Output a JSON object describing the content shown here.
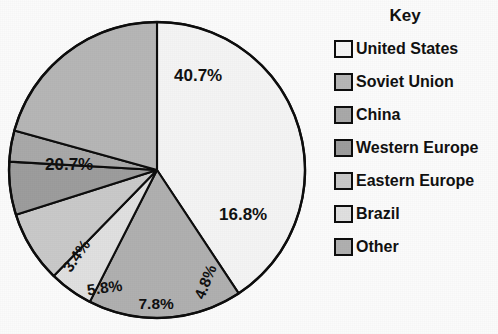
{
  "title": "Share of World Total",
  "legend": {
    "heading": "Key"
  },
  "chart_data": {
    "type": "pie",
    "title": "Share of World Total",
    "value_suffix": "%",
    "legend_position": "right",
    "legend_title": "Key",
    "start_angle_deg": 0,
    "direction": "clockwise",
    "center": {
      "x": 157,
      "y": 170
    },
    "radius": 148,
    "categories": [
      "United States",
      "Soviet Union",
      "China",
      "Western Europe",
      "Eastern Europe",
      "Brazil",
      "Other"
    ],
    "values": [
      40.7,
      20.7,
      3.4,
      5.8,
      7.8,
      4.8,
      16.8
    ],
    "labels": [
      "40.7%",
      "20.7%",
      "3.4%",
      "5.8%",
      "7.8%",
      "4.8%",
      "16.8%"
    ],
    "colors": [
      "#f4f4f4",
      "#b6b6b6",
      "#a9a9a9",
      "#9d9d9d",
      "#c9c9c9",
      "#e0e0e0",
      "#b0b0b0"
    ],
    "slices": [
      {
        "name": "United States",
        "value": 40.7,
        "label": "40.7%",
        "color": "#f4f4f4",
        "label_pos": {
          "x": 198,
          "y": 76
        },
        "label_rotation": 0
      },
      {
        "name": "Other",
        "value": 16.8,
        "label": "16.8%",
        "color": "#b0b0b0",
        "label_pos": {
          "x": 243,
          "y": 215
        },
        "label_rotation": 0
      },
      {
        "name": "Brazil",
        "value": 4.8,
        "label": "4.8%",
        "color": "#e0e0e0",
        "label_pos": {
          "x": 205,
          "y": 282
        },
        "label_rotation": -68
      },
      {
        "name": "Eastern Europe",
        "value": 7.8,
        "label": "7.8%",
        "color": "#c9c9c9",
        "label_pos": {
          "x": 156,
          "y": 304
        },
        "label_rotation": 0
      },
      {
        "name": "Western Europe",
        "value": 5.8,
        "label": "5.8%",
        "color": "#9d9d9d",
        "label_pos": {
          "x": 104,
          "y": 288
        },
        "label_rotation": -8
      },
      {
        "name": "China",
        "value": 3.4,
        "label": "3.4%",
        "color": "#a9a9a9",
        "label_pos": {
          "x": 76,
          "y": 256
        },
        "label_rotation": -55
      },
      {
        "name": "Soviet Union",
        "value": 20.7,
        "label": "20.7%",
        "color": "#b6b6b6",
        "label_pos": {
          "x": 69,
          "y": 165
        },
        "label_rotation": 0
      }
    ],
    "legend_entries": [
      {
        "label": "United States",
        "color": "#f4f4f4"
      },
      {
        "label": "Soviet Union",
        "color": "#b6b6b6"
      },
      {
        "label": "China",
        "color": "#a9a9a9"
      },
      {
        "label": "Western Europe",
        "color": "#9d9d9d"
      },
      {
        "label": "Eastern Europe",
        "color": "#c9c9c9"
      },
      {
        "label": "Brazil",
        "color": "#e0e0e0"
      },
      {
        "label": "Other",
        "color": "#b0b0b0"
      }
    ]
  }
}
